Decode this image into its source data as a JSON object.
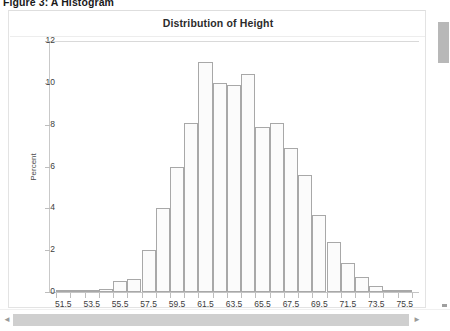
{
  "figure": {
    "caption": "Figure 3: A Histogram"
  },
  "chart_data": {
    "type": "bar",
    "title": "Distribution of Height",
    "xlabel": "",
    "ylabel": "Percent",
    "ylim": [
      0,
      12
    ],
    "yticks": [
      0,
      2,
      4,
      6,
      8,
      10,
      12
    ],
    "xticks": [
      51.5,
      53.5,
      55.5,
      57.5,
      59.5,
      61.5,
      63.5,
      65.5,
      67.5,
      69.5,
      71.5,
      73.5,
      75.5
    ],
    "xlim": [
      50.5,
      76.5
    ],
    "grid": false,
    "legend": null,
    "bin_width": 1,
    "categories": [
      51.5,
      52.5,
      53.5,
      54.5,
      55.5,
      56.5,
      57.5,
      58.5,
      59.5,
      60.5,
      61.5,
      62.5,
      63.5,
      64.5,
      65.5,
      66.5,
      67.5,
      68.5,
      69.5,
      70.5,
      71.5,
      72.5,
      73.5,
      74.5,
      75.5
    ],
    "values": [
      0.05,
      0.08,
      0.1,
      0.15,
      0.55,
      0.6,
      2.0,
      4.0,
      6.0,
      8.1,
      11.0,
      10.0,
      9.9,
      10.4,
      7.9,
      8.1,
      6.9,
      5.6,
      3.7,
      2.4,
      1.4,
      0.7,
      0.3,
      0.12,
      0.05
    ],
    "bar_fill": "#fbfbfb",
    "bar_stroke": "#a8a8a8"
  },
  "scrollbars": {
    "vertical_present": true,
    "horizontal_present": true,
    "left_arrow": "◄",
    "right_arrow": "►"
  }
}
